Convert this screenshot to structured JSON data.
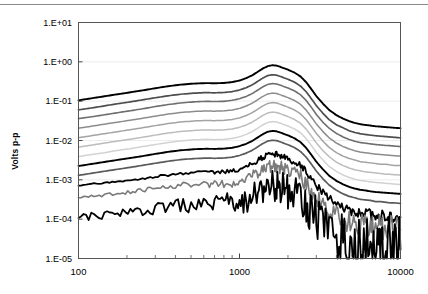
{
  "figure": {
    "top_rule": true,
    "background": "#ffffff",
    "border_color": "#555555",
    "gridline_color": "#ededed"
  },
  "chart_data": {
    "type": "line",
    "title": "",
    "xlabel": "",
    "ylabel": "Volts p-p",
    "xscale": "log",
    "yscale": "log",
    "xlim": [
      100,
      10000
    ],
    "ylim": [
      1e-05,
      10
    ],
    "grid": "horizontal-decades",
    "legend": "none",
    "xtick_labels": [
      "100",
      "1000",
      "10000"
    ],
    "xtick_values": [
      100,
      1000,
      10000
    ],
    "ytick_labels": [
      "1.E+01",
      "1.E+00",
      "1.E-01",
      "1.E-02",
      "1.E-03",
      "1.E-04",
      "1.E-05"
    ],
    "ytick_values": [
      10,
      1,
      0.1,
      0.01,
      0.001,
      0.0001,
      1e-05
    ],
    "x": [
      100,
      120,
      145,
      175,
      210,
      250,
      300,
      360,
      430,
      520,
      620,
      700,
      800,
      900,
      1000,
      1100,
      1200,
      1300,
      1400,
      1500,
      1600,
      1700,
      1800,
      1900,
      2000,
      2200,
      2400,
      2600,
      2800,
      3000,
      3300,
      3600,
      4000,
      4400,
      4800,
      5200,
      5600,
      6000,
      6500,
      7000,
      7500,
      8000,
      8600,
      9200,
      10000
    ],
    "series": [
      {
        "name": "level-1",
        "color": "#000000",
        "width": 1.9,
        "values": [
          0.105,
          0.118,
          0.133,
          0.15,
          0.168,
          0.188,
          0.213,
          0.24,
          0.263,
          0.28,
          0.288,
          0.285,
          0.29,
          0.305,
          0.335,
          0.385,
          0.455,
          0.56,
          0.68,
          0.78,
          0.82,
          0.8,
          0.74,
          0.68,
          0.63,
          0.53,
          0.42,
          0.3,
          0.2,
          0.135,
          0.086,
          0.06,
          0.044,
          0.036,
          0.031,
          0.028,
          0.026,
          0.025,
          0.024,
          0.023,
          0.0225,
          0.022,
          0.0215,
          0.021,
          0.0205
        ]
      },
      {
        "name": "level-2",
        "color": "#4d4d4d",
        "width": 1.7,
        "values": [
          0.06,
          0.067,
          0.076,
          0.086,
          0.096,
          0.108,
          0.122,
          0.137,
          0.15,
          0.16,
          0.165,
          0.163,
          0.166,
          0.175,
          0.192,
          0.22,
          0.26,
          0.32,
          0.389,
          0.446,
          0.469,
          0.458,
          0.423,
          0.389,
          0.36,
          0.303,
          0.24,
          0.172,
          0.114,
          0.077,
          0.049,
          0.034,
          0.025,
          0.021,
          0.0177,
          0.016,
          0.0149,
          0.0143,
          0.0137,
          0.0132,
          0.0129,
          0.0126,
          0.0123,
          0.012,
          0.0117
        ]
      },
      {
        "name": "level-3",
        "color": "#6e6e6e",
        "width": 1.6,
        "values": [
          0.036,
          0.04,
          0.045,
          0.051,
          0.057,
          0.064,
          0.073,
          0.082,
          0.09,
          0.096,
          0.099,
          0.098,
          0.099,
          0.105,
          0.115,
          0.132,
          0.156,
          0.192,
          0.233,
          0.267,
          0.281,
          0.274,
          0.254,
          0.233,
          0.216,
          0.182,
          0.144,
          0.103,
          0.069,
          0.046,
          0.029,
          0.0206,
          0.0151,
          0.0123,
          0.0106,
          0.0096,
          0.0089,
          0.0086,
          0.0082,
          0.0079,
          0.0077,
          0.0075,
          0.0074,
          0.0072,
          0.007
        ]
      },
      {
        "name": "level-4",
        "color": "#8c8c8c",
        "width": 1.5,
        "values": [
          0.0205,
          0.023,
          0.026,
          0.0293,
          0.0328,
          0.0367,
          0.0416,
          0.0469,
          0.0514,
          0.0547,
          0.0563,
          0.0557,
          0.0567,
          0.0596,
          0.0655,
          0.0752,
          0.0889,
          0.1094,
          0.1329,
          0.1524,
          0.1602,
          0.1563,
          0.1446,
          0.1329,
          0.1231,
          0.1036,
          0.0821,
          0.0586,
          0.0391,
          0.0264,
          0.0168,
          0.0117,
          0.0086,
          0.007,
          0.0061,
          0.0055,
          0.0051,
          0.0049,
          0.0047,
          0.0045,
          0.0044,
          0.0043,
          0.0042,
          0.0041,
          0.004
        ]
      },
      {
        "name": "level-5",
        "color": "#a3a3a3",
        "width": 1.5,
        "values": [
          0.0118,
          0.0132,
          0.0149,
          0.0168,
          0.0188,
          0.0211,
          0.0239,
          0.0269,
          0.0295,
          0.0314,
          0.0323,
          0.0319,
          0.0325,
          0.0342,
          0.0375,
          0.0431,
          0.051,
          0.0627,
          0.0762,
          0.0874,
          0.0919,
          0.0896,
          0.0829,
          0.0762,
          0.0706,
          0.0594,
          0.0471,
          0.0336,
          0.0224,
          0.0151,
          0.0096,
          0.0067,
          0.0049,
          0.004,
          0.0035,
          0.0032,
          0.0029,
          0.0028,
          0.0027,
          0.0026,
          0.0025,
          0.0025,
          0.0024,
          0.0023,
          0.0023
        ]
      },
      {
        "name": "level-6",
        "color": "#bcbcbc",
        "width": 1.5,
        "values": [
          0.0068,
          0.0076,
          0.0086,
          0.0097,
          0.0108,
          0.0121,
          0.0137,
          0.0155,
          0.0169,
          0.018,
          0.0186,
          0.0183,
          0.0187,
          0.0196,
          0.0216,
          0.0248,
          0.0293,
          0.036,
          0.0438,
          0.0502,
          0.0528,
          0.0515,
          0.0476,
          0.0438,
          0.0406,
          0.0341,
          0.0271,
          0.0193,
          0.0129,
          0.0087,
          0.0055,
          0.0039,
          0.0028,
          0.0023,
          0.002,
          0.0018,
          0.0017,
          0.0016,
          0.00155,
          0.0015,
          0.00145,
          0.0014,
          0.00138,
          0.00135,
          0.00132
        ]
      },
      {
        "name": "level-7",
        "color": "#d2d2d2",
        "width": 1.5,
        "values": [
          0.0039,
          0.0044,
          0.0049,
          0.0056,
          0.0062,
          0.007,
          0.0079,
          0.0089,
          0.0097,
          0.0104,
          0.0107,
          0.0105,
          0.0107,
          0.0113,
          0.0124,
          0.0143,
          0.0168,
          0.0207,
          0.0252,
          0.0288,
          0.0303,
          0.0296,
          0.0274,
          0.0252,
          0.0233,
          0.0196,
          0.0156,
          0.0111,
          0.0074,
          0.005,
          0.0032,
          0.0022,
          0.00163,
          0.00133,
          0.00115,
          0.00104,
          0.00097,
          0.00093,
          0.00089,
          0.00086,
          0.00084,
          0.00082,
          0.0008,
          0.00078,
          0.00076
        ]
      },
      {
        "name": "level-8",
        "color": "#000000",
        "width": 1.9,
        "values": [
          0.00225,
          0.00252,
          0.00285,
          0.00321,
          0.00359,
          0.00402,
          0.00456,
          0.00514,
          0.00563,
          0.00599,
          0.00617,
          0.0061,
          0.00621,
          0.00653,
          0.00717,
          0.00824,
          0.00974,
          0.01199,
          0.01456,
          0.0167,
          0.01755,
          0.01713,
          0.01584,
          0.01456,
          0.01349,
          0.01135,
          0.00899,
          0.00642,
          0.00428,
          0.00289,
          0.00184,
          0.00128,
          0.00094,
          0.00077,
          0.00066,
          0.0006,
          0.00056,
          0.00054,
          0.00051,
          0.00049,
          0.00048,
          0.00047,
          0.00046,
          0.00045,
          0.00044
        ]
      },
      {
        "name": "level-9",
        "color": "#5a5a5a",
        "width": 1.7,
        "values": [
          0.0013,
          0.00146,
          0.00165,
          0.00186,
          0.00208,
          0.00233,
          0.00264,
          0.00297,
          0.00326,
          0.00347,
          0.00357,
          0.00353,
          0.00359,
          0.00378,
          0.00415,
          0.00477,
          0.00564,
          0.00694,
          0.00843,
          0.00967,
          0.01016,
          0.00991,
          0.00917,
          0.00843,
          0.00781,
          0.00657,
          0.0052,
          0.00372,
          0.00248,
          0.00167,
          0.00106,
          0.00074,
          0.00054,
          0.00044,
          0.00038,
          0.00035,
          0.00032,
          0.00031,
          0.0003,
          0.00028,
          0.00028,
          0.00027,
          0.00026,
          0.00026,
          0.00025
        ]
      },
      {
        "name": "level-10",
        "color": "#000000",
        "width": 1.8,
        "noise": 0.1,
        "values": [
          0.00072,
          0.00078,
          0.00084,
          0.00091,
          0.00098,
          0.00108,
          0.0012,
          0.00133,
          0.00145,
          0.00154,
          0.00159,
          0.00157,
          0.0016,
          0.00168,
          0.00184,
          0.00212,
          0.0025,
          0.00308,
          0.00374,
          0.00429,
          0.00451,
          0.0044,
          0.00407,
          0.00374,
          0.00347,
          0.00292,
          0.00231,
          0.00165,
          0.0011,
          0.00074,
          0.00047,
          0.00033,
          0.00024,
          0.000196,
          0.000169,
          0.000153,
          0.000143,
          0.000137,
          0.000131,
          0.000126,
          0.000123,
          0.00012,
          0.000117,
          0.000115,
          0.000112
        ]
      },
      {
        "name": "level-11",
        "color": "#7a7a7a",
        "width": 1.6,
        "noise": 0.22,
        "values": [
          0.00035,
          0.00038,
          0.00041,
          0.00045,
          0.00049,
          0.00054,
          0.0006,
          0.00066,
          0.00072,
          0.00077,
          0.00079,
          0.00078,
          0.0008,
          0.00084,
          0.00092,
          0.00106,
          0.00125,
          0.00154,
          0.00187,
          0.00214,
          0.00225,
          0.0022,
          0.00204,
          0.00187,
          0.00173,
          0.00146,
          0.00116,
          0.00082,
          0.00055,
          0.00037,
          0.00024,
          0.000164,
          0.000121,
          9.8e-05,
          8.5e-05,
          7.7e-05,
          7.1e-05,
          6.8e-05,
          6.5e-05,
          6.3e-05,
          6.1e-05,
          6e-05,
          5.9e-05,
          5.7e-05,
          5.6e-05
        ]
      },
      {
        "name": "level-12",
        "color": "#000000",
        "width": 1.8,
        "noise": 0.55,
        "values": [
          0.000105,
          0.000118,
          0.00013,
          0.00014,
          0.000152,
          0.000166,
          0.000182,
          0.0002,
          0.000218,
          0.000232,
          0.000239,
          0.000236,
          0.00024,
          0.000252,
          0.000277,
          0.000318,
          0.000375,
          0.000462,
          0.000561,
          0.000643,
          0.000676,
          0.00066,
          0.000611,
          0.000561,
          0.00052,
          0.000437,
          0.000347,
          0.000248,
          0.000165,
          0.000111,
          7.1e-05,
          4.9e-05,
          3.6e-05,
          2.94e-05,
          2.54e-05,
          2.3e-05,
          2.14e-05,
          2.05e-05,
          1.96e-05,
          1.89e-05,
          1.84e-05,
          1.8e-05,
          1.76e-05,
          1.72e-05,
          1.68e-05
        ]
      }
    ]
  }
}
